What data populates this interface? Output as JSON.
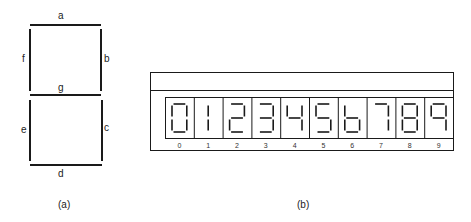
{
  "figure_a": {
    "caption": "(a)",
    "segments": {
      "a": "a",
      "b": "b",
      "c": "c",
      "d": "d",
      "e": "e",
      "f": "f",
      "g": "g"
    }
  },
  "figure_b": {
    "caption": "(b)",
    "digits": [
      {
        "label": "0",
        "on": [
          "a",
          "b",
          "c",
          "d",
          "e",
          "f"
        ]
      },
      {
        "label": "1",
        "on": [
          "b",
          "c"
        ],
        "centered": true
      },
      {
        "label": "2",
        "on": [
          "a",
          "b",
          "g",
          "e",
          "d"
        ]
      },
      {
        "label": "3",
        "on": [
          "a",
          "b",
          "g",
          "c",
          "d"
        ]
      },
      {
        "label": "4",
        "on": [
          "f",
          "g",
          "b",
          "c"
        ]
      },
      {
        "label": "5",
        "on": [
          "a",
          "f",
          "g",
          "c",
          "d"
        ]
      },
      {
        "label": "6",
        "on": [
          "f",
          "g",
          "e",
          "c",
          "d"
        ]
      },
      {
        "label": "7",
        "on": [
          "a",
          "b",
          "c"
        ]
      },
      {
        "label": "8",
        "on": [
          "a",
          "b",
          "c",
          "d",
          "e",
          "f",
          "g"
        ]
      },
      {
        "label": "9",
        "on": [
          "a",
          "b",
          "f",
          "g",
          "c"
        ]
      }
    ]
  },
  "colors": {
    "ink": "#1a1a1a",
    "background": "#ffffff"
  }
}
